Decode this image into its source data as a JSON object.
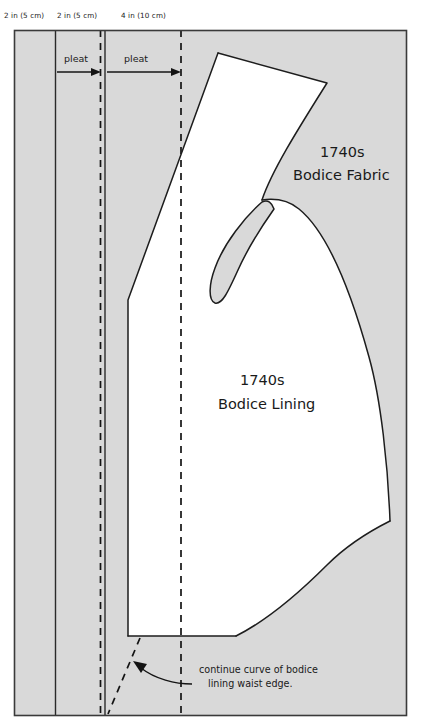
{
  "document": {
    "title": "1740s bodice cutting layout diagram",
    "type": "sewing-pattern-layout"
  },
  "measurements": [
    {
      "id": "m1",
      "label": "2 in (5 cm)"
    },
    {
      "id": "m2",
      "label": "2 in (5 cm)"
    },
    {
      "id": "m3",
      "label": "4 in (10 cm)"
    }
  ],
  "pleats": [
    {
      "id": "pleat-1",
      "label": "pleat"
    },
    {
      "id": "pleat-2",
      "label": "pleat"
    }
  ],
  "pieces": [
    {
      "id": "fabric",
      "line1": "1740s",
      "line2": "Bodice Fabric"
    },
    {
      "id": "lining",
      "line1": "1740s",
      "line2": "Bodice Lining"
    }
  ],
  "annotations": [
    {
      "id": "waist-note",
      "line1": "continue curve of bodice",
      "line2": "lining waist edge."
    }
  ],
  "colors": {
    "fabric": "#d9d9d9",
    "piece": "#ffffff",
    "ink": "#1d1d1d",
    "border": "#3a3a3a",
    "background": "#ffffff"
  }
}
